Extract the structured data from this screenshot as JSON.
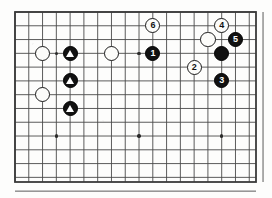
{
  "figure": {
    "kind": "go-board-diagram",
    "title": "",
    "board": {
      "left": 15,
      "top": 12,
      "right": 256,
      "bottom": 182,
      "cell": 13.78,
      "cols": 18,
      "rows": 13,
      "line_color": "#4a4a4a",
      "border_color": "#3a3a3a",
      "background_color": "#fdfdfc"
    },
    "star_points": [
      {
        "name": "star-point-left",
        "col": 3,
        "row": 3
      },
      {
        "name": "star-point-center",
        "col": 9,
        "row": 3
      },
      {
        "name": "star-point-right",
        "col": 15,
        "row": 3
      },
      {
        "name": "star-point-lower-left",
        "col": 3,
        "row": 9
      },
      {
        "name": "star-point-lower-center",
        "col": 9,
        "row": 9
      },
      {
        "name": "star-point-lower-right",
        "col": 15,
        "row": 9
      }
    ],
    "stones": [
      {
        "name": "white-stone-left-upper",
        "color": "white",
        "label": "",
        "mark": "",
        "col": 2,
        "row": 3
      },
      {
        "name": "white-stone-left-lower",
        "color": "white",
        "label": "",
        "mark": "",
        "col": 2,
        "row": 6
      },
      {
        "name": "white-stone-center-left",
        "color": "white",
        "label": "",
        "mark": "",
        "col": 7,
        "row": 3
      },
      {
        "name": "black-stone-triangle-1",
        "color": "black",
        "label": "",
        "mark": "triangle",
        "col": 4,
        "row": 3
      },
      {
        "name": "black-stone-triangle-2",
        "color": "black",
        "label": "",
        "mark": "triangle",
        "col": 4,
        "row": 5
      },
      {
        "name": "black-stone-triangle-3",
        "color": "black",
        "label": "",
        "mark": "triangle",
        "col": 4,
        "row": 7
      },
      {
        "name": "white-stone-right-upper",
        "color": "white",
        "label": "",
        "mark": "",
        "col": 14,
        "row": 2
      },
      {
        "name": "black-stone-right-center",
        "color": "black",
        "label": "",
        "mark": "",
        "col": 15,
        "row": 3
      },
      {
        "name": "move-stone-1",
        "color": "black",
        "label": "1",
        "mark": "",
        "col": 10,
        "row": 3
      },
      {
        "name": "move-stone-2",
        "color": "white",
        "label": "2",
        "mark": "",
        "col": 13,
        "row": 4
      },
      {
        "name": "move-stone-3",
        "color": "black",
        "label": "3",
        "mark": "",
        "col": 15,
        "row": 5
      },
      {
        "name": "move-stone-4",
        "color": "white",
        "label": "4",
        "mark": "",
        "col": 15,
        "row": 1
      },
      {
        "name": "move-stone-5",
        "color": "black",
        "label": "5",
        "mark": "",
        "col": 16,
        "row": 2
      },
      {
        "name": "move-stone-6",
        "color": "white",
        "label": "6",
        "mark": "",
        "col": 10,
        "row": 1
      }
    ],
    "move_numbers": [
      "1",
      "2",
      "3",
      "4",
      "5",
      "6"
    ]
  }
}
